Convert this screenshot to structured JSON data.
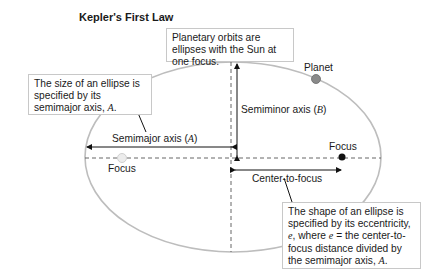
{
  "title": "Kepler's First Law",
  "callouts": {
    "top": "Planetary orbits are ellipses with the Sun at one focus.",
    "left_pre": "The size of an ellipse is specified by its semimajor axis, ",
    "left_var": "A",
    "left_post": ".",
    "right_l1": "The shape of an ellipse is specified by its eccentricity, ",
    "right_var_e": "e",
    "right_l1_post": ",",
    "right_where": "where ",
    "right_var_e2": "e",
    "right_mid": " = the center-to-focus distance divided by the semimajor axis, ",
    "right_var_a": "A",
    "right_end": "."
  },
  "labels": {
    "planet": "Planet",
    "semiminor_pre": "Semiminor axis (",
    "semiminor_var": "B",
    "semiminor_post": ")",
    "semimajor_pre": "Semimajor axis (",
    "semimajor_var": "A",
    "semimajor_post": ")",
    "focus_left": "Focus",
    "focus_right": "Focus",
    "center_to_focus": "Center-to-focus"
  },
  "colors": {
    "ellipse": "#bdbdbd",
    "planet": "#8a8a8a",
    "sun_focus": "#111111",
    "empty_focus": "#e0e0e0",
    "dashed": "#555555",
    "box_border": "#c8c8c8"
  }
}
